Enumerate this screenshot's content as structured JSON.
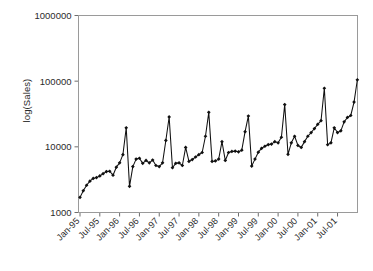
{
  "chart_data": {
    "type": "line",
    "title": "",
    "subtitle": "",
    "xlabel": "",
    "ylabel": "log(Sales)",
    "yscale": "log",
    "ylim": [
      1000,
      1000000
    ],
    "ytick_labels": [
      "1000",
      "10000",
      "100000",
      "1000000"
    ],
    "ytick_values": [
      1000,
      10000,
      100000,
      1000000
    ],
    "grid": false,
    "legend": false,
    "legend_position": "none",
    "xtick_labels": [
      "Jan-95",
      "Jul-95",
      "Jan-96",
      "Jul-96",
      "Jan-97",
      "Jul-97",
      "Jan-98",
      "Jul-98",
      "Jan-99",
      "Jul-99",
      "Jan-00",
      "Jul-00",
      "Jan-01",
      "Jul-01"
    ],
    "xtick_indices": [
      0,
      6,
      12,
      18,
      24,
      30,
      36,
      42,
      48,
      54,
      60,
      66,
      72,
      78
    ],
    "marker": "diamond",
    "series": [
      {
        "name": "Sales",
        "x": [
          "Jan-95",
          "Feb-95",
          "Mar-95",
          "Apr-95",
          "May-95",
          "Jun-95",
          "Jul-95",
          "Aug-95",
          "Sep-95",
          "Oct-95",
          "Nov-95",
          "Dec-95",
          "Jan-96",
          "Feb-96",
          "Mar-96",
          "Apr-96",
          "May-96",
          "Jun-96",
          "Jul-96",
          "Aug-96",
          "Sep-96",
          "Oct-96",
          "Nov-96",
          "Dec-96",
          "Jan-97",
          "Feb-97",
          "Mar-97",
          "Apr-97",
          "May-97",
          "Jun-97",
          "Jul-97",
          "Aug-97",
          "Sep-97",
          "Oct-97",
          "Nov-97",
          "Dec-97",
          "Jan-98",
          "Feb-98",
          "Mar-98",
          "Apr-98",
          "May-98",
          "Jun-98",
          "Jul-98",
          "Aug-98",
          "Sep-98",
          "Oct-98",
          "Nov-98",
          "Dec-98",
          "Jan-99",
          "Feb-99",
          "Mar-99",
          "Apr-99",
          "May-99",
          "Jun-99",
          "Jul-99",
          "Aug-99",
          "Sep-99",
          "Oct-99",
          "Nov-99",
          "Dec-99",
          "Jan-00",
          "Feb-00",
          "Mar-00",
          "Apr-00",
          "May-00",
          "Jun-00",
          "Jul-00",
          "Aug-00",
          "Sep-00",
          "Oct-00",
          "Nov-00",
          "Dec-00",
          "Jan-01",
          "Feb-01",
          "Mar-01",
          "Apr-01",
          "May-01",
          "Jun-01",
          "Jul-01",
          "Aug-01",
          "Sep-01",
          "Oct-01",
          "Nov-01",
          "Dec-01"
        ],
        "values": [
          1700,
          2150,
          2600,
          3000,
          3300,
          3400,
          3600,
          3900,
          4200,
          4250,
          3700,
          4900,
          5700,
          7600,
          19500,
          2500,
          5000,
          6500,
          6700,
          5600,
          6200,
          5700,
          6300,
          5200,
          5000,
          5700,
          12500,
          28500,
          4800,
          5600,
          5700,
          5200,
          9800,
          6000,
          6400,
          7000,
          7600,
          8200,
          14500,
          33500,
          6000,
          6100,
          6500,
          12000,
          6200,
          8200,
          8500,
          8600,
          8400,
          8900,
          17000,
          29500,
          5100,
          6500,
          8300,
          9500,
          10200,
          10800,
          11000,
          12000,
          11500,
          14000,
          44000,
          7700,
          11500,
          14500,
          10500,
          9800,
          12000,
          14500,
          16500,
          19000,
          22000,
          25000,
          78000,
          10800,
          11500,
          19500,
          16500,
          17500,
          24000,
          28000,
          30000,
          48000
        ]
      }
    ],
    "end_value": 105000
  },
  "chart_meta": {
    "y_axis_label": "log(Sales)",
    "point_count": 84
  }
}
